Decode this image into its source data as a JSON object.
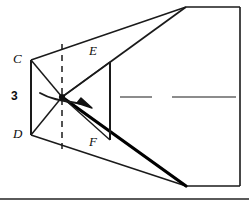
{
  "figure": {
    "labels": {
      "C": "C",
      "D": "D",
      "E": "E",
      "F": "F",
      "dimension_3": "3"
    },
    "colors": {
      "stroke": "#1a1a1a",
      "thick_stroke": "#000000",
      "centerline": "#8c8c8c",
      "background": "#ffffff",
      "baseline": "#5a5a5a"
    },
    "icons": {
      "rotation_arrow": "curved-arrow-right",
      "center_node": "vertex-dot"
    },
    "geometry": {
      "center_node": {
        "x": 62,
        "y": 97
      },
      "vertex_C": {
        "x": 31,
        "y": 60
      },
      "vertex_D": {
        "x": 31,
        "y": 135
      },
      "vertex_E": {
        "x": 110,
        "y": 62
      },
      "vertex_F": {
        "x": 110,
        "y": 140
      },
      "apex_top_right": {
        "x": 186,
        "y": 7
      },
      "apex_bottom_right": {
        "x": 186,
        "y": 185
      },
      "right_edge_x": 240,
      "baseline_y": 199,
      "dashed_axis_x": 62
    }
  }
}
